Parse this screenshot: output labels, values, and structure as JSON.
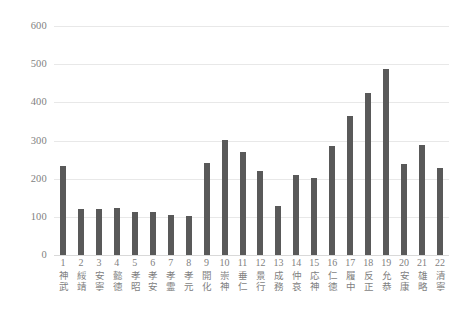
{
  "chart_data": {
    "type": "bar",
    "title": "",
    "subtitle": "",
    "xlabel": "",
    "ylabel": "",
    "ylim": [
      0,
      600
    ],
    "yticks": [
      0,
      100,
      200,
      300,
      400,
      500,
      600
    ],
    "grid": true,
    "legend": false,
    "legend_position": "none",
    "bar_color": "#595959",
    "gridline_color": "#e8e8e8",
    "tick_label_color": "#7f7f7f",
    "categories": [
      "1",
      "2",
      "3",
      "4",
      "5",
      "6",
      "7",
      "8",
      "9",
      "10",
      "11",
      "12",
      "13",
      "14",
      "15",
      "16",
      "17",
      "18",
      "19",
      "20",
      "21",
      "22"
    ],
    "category_names": [
      "神武",
      "綏靖",
      "安寧",
      "懿徳",
      "孝昭",
      "孝安",
      "孝霊",
      "孝元",
      "開化",
      "崇神",
      "垂仁",
      "景行",
      "成務",
      "仲哀",
      "応神",
      "仁徳",
      "履中",
      "反正",
      "允恭",
      "安康",
      "雄略",
      "清寧"
    ],
    "values": [
      232,
      121,
      121,
      122,
      112,
      112,
      106,
      103,
      242,
      301,
      271,
      220,
      128,
      209,
      203,
      286,
      364,
      424,
      487,
      238,
      288,
      227
    ]
  }
}
